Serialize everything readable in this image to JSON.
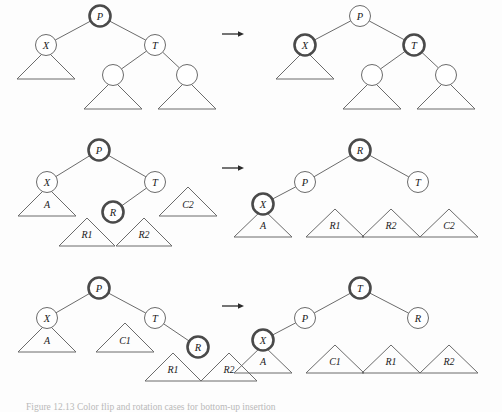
{
  "figure": {
    "background_color": "#fdfdfd",
    "stroke_color": "#6b6b6b",
    "highlight_color": "#4a4a4a",
    "text_color": "#1a1a1a",
    "arrow_glyph": "right-arrow",
    "caption_partial": "Figure 12.13  Color flip and rotation cases for bottom-up insertion"
  },
  "rows": [
    {
      "id": "row-1",
      "before": {
        "nodes": [
          {
            "id": "r1b-P",
            "label": "P",
            "cx": 100,
            "cy": 16,
            "r": 10.5,
            "highlight": true
          },
          {
            "id": "r1b-X",
            "label": "X",
            "cx": 46,
            "cy": 45,
            "r": 10.5,
            "highlight": false
          },
          {
            "id": "r1b-T",
            "label": "T",
            "cx": 155,
            "cy": 45,
            "r": 10.5,
            "highlight": false
          },
          {
            "id": "r1b-L",
            "label": "",
            "cx": 113,
            "cy": 75,
            "r": 10.5,
            "highlight": false
          },
          {
            "id": "r1b-R",
            "label": "",
            "cx": 187,
            "cy": 75,
            "r": 10.5,
            "highlight": false
          }
        ],
        "edges": [
          {
            "from": "r1b-P",
            "to": "r1b-X"
          },
          {
            "from": "r1b-P",
            "to": "r1b-T"
          },
          {
            "from": "r1b-T",
            "to": "r1b-L"
          },
          {
            "from": "r1b-T",
            "to": "r1b-R"
          }
        ],
        "subtrees": [
          {
            "id": "r1b-t1",
            "label": "",
            "apex_x": 46,
            "apex_y": 50,
            "half_width": 29,
            "height": 29
          },
          {
            "id": "r1b-t2",
            "label": "",
            "apex_x": 113,
            "apex_y": 80,
            "half_width": 29,
            "height": 29
          },
          {
            "id": "r1b-t3",
            "label": "",
            "apex_x": 187,
            "apex_y": 80,
            "half_width": 29,
            "height": 29
          }
        ]
      },
      "arrow": {
        "x1": 222,
        "y1": 34,
        "x2": 244,
        "y2": 34
      },
      "after": {
        "nodes": [
          {
            "id": "r1a-P",
            "label": "P",
            "cx": 360,
            "cy": 16,
            "r": 10.5,
            "highlight": false
          },
          {
            "id": "r1a-X",
            "label": "X",
            "cx": 305,
            "cy": 45,
            "r": 10.5,
            "highlight": true
          },
          {
            "id": "r1a-T",
            "label": "T",
            "cx": 414,
            "cy": 45,
            "r": 10.5,
            "highlight": true
          },
          {
            "id": "r1a-L",
            "label": "",
            "cx": 372,
            "cy": 75,
            "r": 10.5,
            "highlight": false
          },
          {
            "id": "r1a-R",
            "label": "",
            "cx": 446,
            "cy": 75,
            "r": 10.5,
            "highlight": false
          }
        ],
        "edges": [
          {
            "from": "r1a-P",
            "to": "r1a-X"
          },
          {
            "from": "r1a-P",
            "to": "r1a-T"
          },
          {
            "from": "r1a-T",
            "to": "r1a-L"
          },
          {
            "from": "r1a-T",
            "to": "r1a-R"
          }
        ],
        "subtrees": [
          {
            "id": "r1a-t1",
            "label": "",
            "apex_x": 305,
            "apex_y": 50,
            "half_width": 29,
            "height": 29
          },
          {
            "id": "r1a-t2",
            "label": "",
            "apex_x": 372,
            "apex_y": 80,
            "half_width": 29,
            "height": 29
          },
          {
            "id": "r1a-t3",
            "label": "",
            "apex_x": 446,
            "apex_y": 80,
            "half_width": 29,
            "height": 29
          }
        ]
      }
    },
    {
      "id": "row-2",
      "before": {
        "nodes": [
          {
            "id": "r2b-P",
            "label": "P",
            "cx": 99,
            "cy": 150,
            "r": 10.5,
            "highlight": true
          },
          {
            "id": "r2b-X",
            "label": "X",
            "cx": 47,
            "cy": 182,
            "r": 10.5,
            "highlight": false
          },
          {
            "id": "r2b-T",
            "label": "T",
            "cx": 155,
            "cy": 182,
            "r": 10.5,
            "highlight": false
          },
          {
            "id": "r2b-R",
            "label": "R",
            "cx": 113,
            "cy": 212,
            "r": 10.5,
            "highlight": true
          }
        ],
        "edges": [
          {
            "from": "r2b-P",
            "to": "r2b-X"
          },
          {
            "from": "r2b-P",
            "to": "r2b-T"
          },
          {
            "from": "r2b-T",
            "to": "r2b-R"
          }
        ],
        "subtrees": [
          {
            "id": "r2b-A",
            "label": "A",
            "apex_x": 47,
            "apex_y": 187,
            "half_width": 29,
            "height": 29
          },
          {
            "id": "r2b-C2",
            "label": "C2",
            "apex_x": 188,
            "apex_y": 187,
            "half_width": 29,
            "height": 29
          },
          {
            "id": "r2b-R1",
            "label": "R1",
            "apex_x": 87,
            "apex_y": 218,
            "half_width": 28,
            "height": 28
          },
          {
            "id": "r2b-R2",
            "label": "R2",
            "apex_x": 144,
            "apex_y": 218,
            "half_width": 28,
            "height": 28
          }
        ]
      },
      "arrow": {
        "x1": 222,
        "y1": 168,
        "x2": 244,
        "y2": 168
      },
      "after": {
        "nodes": [
          {
            "id": "r2a-R",
            "label": "R",
            "cx": 360,
            "cy": 150,
            "r": 10.5,
            "highlight": true
          },
          {
            "id": "r2a-P",
            "label": "P",
            "cx": 305,
            "cy": 182,
            "r": 10.5,
            "highlight": false
          },
          {
            "id": "r2a-T",
            "label": "T",
            "cx": 418,
            "cy": 182,
            "r": 10.5,
            "highlight": false
          },
          {
            "id": "r2a-X",
            "label": "X",
            "cx": 263,
            "cy": 204,
            "r": 10.5,
            "highlight": true
          }
        ],
        "edges": [
          {
            "from": "r2a-R",
            "to": "r2a-P"
          },
          {
            "from": "r2a-R",
            "to": "r2a-T"
          },
          {
            "from": "r2a-P",
            "to": "r2a-X"
          }
        ],
        "subtrees": [
          {
            "id": "r2a-A",
            "label": "A",
            "apex_x": 263,
            "apex_y": 209,
            "half_width": 29,
            "height": 28
          },
          {
            "id": "r2a-R1",
            "label": "R1",
            "apex_x": 335,
            "apex_y": 209,
            "half_width": 29,
            "height": 28
          },
          {
            "id": "r2a-R2",
            "label": "R2",
            "apex_x": 391,
            "apex_y": 209,
            "half_width": 29,
            "height": 28
          },
          {
            "id": "r2a-C2",
            "label": "C2",
            "apex_x": 449,
            "apex_y": 209,
            "half_width": 29,
            "height": 28
          }
        ]
      }
    },
    {
      "id": "row-3",
      "before": {
        "nodes": [
          {
            "id": "r3b-P",
            "label": "P",
            "cx": 99,
            "cy": 288,
            "r": 10.5,
            "highlight": true
          },
          {
            "id": "r3b-X",
            "label": "X",
            "cx": 47,
            "cy": 318,
            "r": 10.5,
            "highlight": false
          },
          {
            "id": "r3b-T",
            "label": "T",
            "cx": 155,
            "cy": 318,
            "r": 10.5,
            "highlight": false
          },
          {
            "id": "r3b-R",
            "label": "R",
            "cx": 198,
            "cy": 347,
            "r": 10.5,
            "highlight": true
          }
        ],
        "edges": [
          {
            "from": "r3b-P",
            "to": "r3b-X"
          },
          {
            "from": "r3b-P",
            "to": "r3b-T"
          },
          {
            "from": "r3b-T",
            "to": "r3b-R"
          }
        ],
        "subtrees": [
          {
            "id": "r3b-A",
            "label": "A",
            "apex_x": 47,
            "apex_y": 323,
            "half_width": 29,
            "height": 29
          },
          {
            "id": "r3b-C1",
            "label": "C1",
            "apex_x": 125,
            "apex_y": 323,
            "half_width": 29,
            "height": 29
          },
          {
            "id": "r3b-R1",
            "label": "R1",
            "apex_x": 173,
            "apex_y": 353,
            "half_width": 28,
            "height": 28
          },
          {
            "id": "r3b-R2",
            "label": "R2",
            "apex_x": 229,
            "apex_y": 353,
            "half_width": 28,
            "height": 28
          }
        ]
      },
      "arrow": {
        "x1": 222,
        "y1": 306,
        "x2": 244,
        "y2": 306
      },
      "after": {
        "nodes": [
          {
            "id": "r3a-T",
            "label": "T",
            "cx": 360,
            "cy": 288,
            "r": 10.5,
            "highlight": true
          },
          {
            "id": "r3a-P",
            "label": "P",
            "cx": 305,
            "cy": 318,
            "r": 10.5,
            "highlight": false
          },
          {
            "id": "r3a-R",
            "label": "R",
            "cx": 418,
            "cy": 318,
            "r": 10.5,
            "highlight": false
          },
          {
            "id": "r3a-X",
            "label": "X",
            "cx": 263,
            "cy": 340,
            "r": 10.5,
            "highlight": true
          }
        ],
        "edges": [
          {
            "from": "r3a-T",
            "to": "r3a-P"
          },
          {
            "from": "r3a-T",
            "to": "r3a-R"
          },
          {
            "from": "r3a-P",
            "to": "r3a-X"
          }
        ],
        "subtrees": [
          {
            "id": "r3a-A",
            "label": "A",
            "apex_x": 263,
            "apex_y": 345,
            "half_width": 29,
            "height": 28
          },
          {
            "id": "r3a-C1",
            "label": "C1",
            "apex_x": 335,
            "apex_y": 345,
            "half_width": 29,
            "height": 28
          },
          {
            "id": "r3a-R1",
            "label": "R1",
            "apex_x": 391,
            "apex_y": 345,
            "half_width": 29,
            "height": 28
          },
          {
            "id": "r3a-R2",
            "label": "R2",
            "apex_x": 449,
            "apex_y": 345,
            "half_width": 29,
            "height": 28
          }
        ]
      }
    }
  ]
}
